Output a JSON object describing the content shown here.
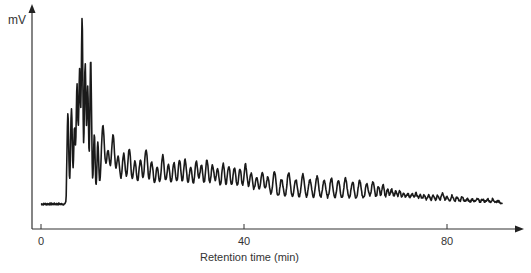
{
  "chart_data": {
    "type": "line",
    "title": "",
    "xlabel": "Retention time (min)",
    "ylabel": "mV",
    "xlim": [
      -2,
      92
    ],
    "xticks": [
      0,
      40,
      80
    ],
    "xtick_labels": [
      "0",
      "40",
      "80"
    ],
    "yticks": [],
    "grid": false,
    "legend": null,
    "baseline_level": 0,
    "peaks": {
      "columns": [
        "time_min",
        "relative_height"
      ],
      "values": [
        [
          5.3,
          0.46
        ],
        [
          6.0,
          0.48
        ],
        [
          6.6,
          0.38
        ],
        [
          7.1,
          0.62
        ],
        [
          7.6,
          0.7
        ],
        [
          8.1,
          1.0
        ],
        [
          8.7,
          0.74
        ],
        [
          9.2,
          0.62
        ],
        [
          9.8,
          0.78
        ],
        [
          10.5,
          0.35
        ],
        [
          11.2,
          0.3
        ],
        [
          12.2,
          0.4
        ],
        [
          13.2,
          0.25
        ],
        [
          14.2,
          0.34
        ],
        [
          15.2,
          0.22
        ],
        [
          16.3,
          0.24
        ],
        [
          17.4,
          0.27
        ],
        [
          18.5,
          0.2
        ],
        [
          19.6,
          0.21
        ],
        [
          20.7,
          0.27
        ],
        [
          21.8,
          0.2
        ],
        [
          22.9,
          0.17
        ],
        [
          24.0,
          0.24
        ],
        [
          25.1,
          0.19
        ],
        [
          26.2,
          0.2
        ],
        [
          27.3,
          0.21
        ],
        [
          28.4,
          0.22
        ],
        [
          29.5,
          0.18
        ],
        [
          30.6,
          0.21
        ],
        [
          31.6,
          0.19
        ],
        [
          32.7,
          0.22
        ],
        [
          33.8,
          0.19
        ],
        [
          34.8,
          0.17
        ],
        [
          35.9,
          0.2
        ],
        [
          37.0,
          0.19
        ],
        [
          38.1,
          0.18
        ],
        [
          39.2,
          0.17
        ],
        [
          40.3,
          0.2
        ],
        [
          41.4,
          0.15
        ],
        [
          42.5,
          0.13
        ],
        [
          43.6,
          0.16
        ],
        [
          44.7,
          0.13
        ],
        [
          46.0,
          0.16
        ],
        [
          47.4,
          0.12
        ],
        [
          48.8,
          0.16
        ],
        [
          50.2,
          0.12
        ],
        [
          51.6,
          0.15
        ],
        [
          53.0,
          0.12
        ],
        [
          54.4,
          0.14
        ],
        [
          55.8,
          0.12
        ],
        [
          57.2,
          0.13
        ],
        [
          58.6,
          0.12
        ],
        [
          60.0,
          0.13
        ],
        [
          61.4,
          0.11
        ],
        [
          62.8,
          0.12
        ],
        [
          64.2,
          0.1
        ],
        [
          65.4,
          0.11
        ],
        [
          66.5,
          0.09
        ],
        [
          67.4,
          0.1
        ],
        [
          68.3,
          0.07
        ],
        [
          69.1,
          0.07
        ],
        [
          69.9,
          0.06
        ],
        [
          70.7,
          0.06
        ],
        [
          71.5,
          0.05
        ],
        [
          72.3,
          0.05
        ],
        [
          73.1,
          0.05
        ],
        [
          73.9,
          0.05
        ],
        [
          74.7,
          0.04
        ],
        [
          75.5,
          0.04
        ],
        [
          76.4,
          0.04
        ],
        [
          77.3,
          0.04
        ],
        [
          78.2,
          0.04
        ],
        [
          79.1,
          0.05
        ],
        [
          80.0,
          0.03
        ],
        [
          81.0,
          0.04
        ],
        [
          82.0,
          0.03
        ],
        [
          83.0,
          0.03
        ],
        [
          84.0,
          0.02
        ],
        [
          85.0,
          0.02
        ],
        [
          86.0,
          0.02
        ],
        [
          87.0,
          0.02
        ],
        [
          88.0,
          0.02
        ],
        [
          89.0,
          0.02
        ],
        [
          90.0,
          0.01
        ]
      ]
    },
    "trace_range_min": [
      0,
      91
    ]
  }
}
